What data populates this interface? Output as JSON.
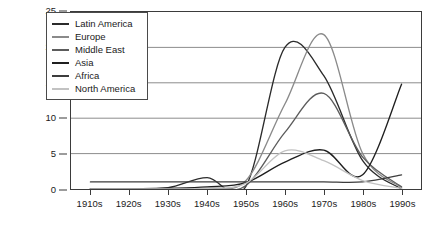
{
  "chart_data": {
    "type": "line",
    "title": "",
    "xlabel": "",
    "ylabel": "",
    "grid": true,
    "legend_position": "top-left-inside",
    "categories": [
      "1910s",
      "1920s",
      "1930s",
      "1940s",
      "1950s",
      "1960s",
      "1970s",
      "1980s",
      "1990s"
    ],
    "x": [
      1910,
      1920,
      1930,
      1940,
      1950,
      1960,
      1970,
      1980,
      1990
    ],
    "xlim": [
      1905,
      1995
    ],
    "ylim": [
      0,
      25
    ],
    "yticks": [
      0,
      5,
      10,
      15,
      20,
      25
    ],
    "ytick_labels": [
      "0",
      "5",
      "10",
      "15",
      "20",
      "25"
    ],
    "series": [
      {
        "name": "Latin America",
        "color": "#2b2b2b",
        "values": [
          0.0,
          0.0,
          0.2,
          1.6,
          0.4,
          20.0,
          16.0,
          4.0,
          0.0
        ]
      },
      {
        "name": "Europe",
        "color": "#8a8a8a",
        "values": [
          0.0,
          0.0,
          0.0,
          0.2,
          1.2,
          12.0,
          21.8,
          5.0,
          0.2
        ]
      },
      {
        "name": "Middle East",
        "color": "#5c5c5c",
        "values": [
          0.0,
          0.0,
          0.0,
          0.1,
          0.5,
          8.0,
          13.5,
          4.5,
          0.3
        ]
      },
      {
        "name": "Asia",
        "color": "#1f1f1f",
        "values": [
          0.0,
          0.0,
          0.1,
          0.3,
          0.9,
          3.8,
          5.5,
          2.0,
          14.8
        ]
      },
      {
        "name": "Africa",
        "color": "#3d3d3d",
        "values": [
          1.0,
          1.0,
          1.0,
          1.0,
          1.0,
          1.0,
          1.0,
          1.0,
          2.0
        ]
      },
      {
        "name": "North America",
        "color": "#c2c2c2",
        "values": [
          0.0,
          0.0,
          0.0,
          0.1,
          0.8,
          5.4,
          4.0,
          1.2,
          0.1
        ]
      }
    ]
  },
  "legend": {
    "items": [
      {
        "label": "Latin America"
      },
      {
        "label": "Europe"
      },
      {
        "label": "Middle East"
      },
      {
        "label": "Asia"
      },
      {
        "label": "Africa"
      },
      {
        "label": "North America"
      }
    ]
  },
  "caption": {
    "text": ""
  }
}
